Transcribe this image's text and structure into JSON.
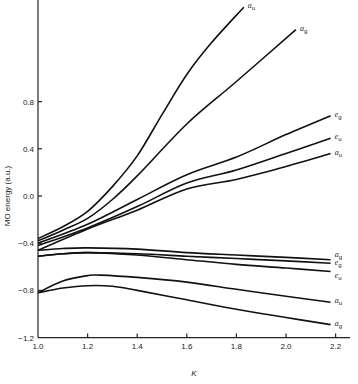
{
  "chart_data": {
    "type": "line",
    "title": "",
    "xlabel": "K",
    "ylabel": "MO energy (a.u.)",
    "xlim": [
      1.0,
      2.25
    ],
    "ylim": [
      -1.2,
      1.65
    ],
    "grid": false,
    "legend": "inline labels at right end of each curve",
    "x_ticks": [
      1.0,
      1.2,
      1.4,
      1.6,
      1.8,
      2.0,
      2.2
    ],
    "x_tick_labels": [
      "1.0",
      "1.2",
      "1.4",
      "1.6",
      "1.8",
      "2.0",
      "2.2"
    ],
    "y_ticks": [
      -1.2,
      -0.8,
      -0.4,
      0.0,
      0.4,
      0.8
    ],
    "y_tick_labels": [
      "−1.2",
      "−0.8",
      "−0.4",
      "0.0",
      "0.4",
      "0.8"
    ],
    "series": [
      {
        "name": "a_u",
        "label_main": "a",
        "label_sub": "u",
        "x": [
          1.0,
          1.1,
          1.2,
          1.3,
          1.4,
          1.5,
          1.6,
          1.7,
          1.83
        ],
        "y": [
          -0.36,
          -0.26,
          -0.13,
          0.08,
          0.34,
          0.69,
          1.03,
          1.3,
          1.6
        ]
      },
      {
        "name": "a_g",
        "label_main": "a",
        "label_sub": "g",
        "x": [
          1.0,
          1.1,
          1.2,
          1.3,
          1.4,
          1.6,
          1.8,
          2.04
        ],
        "y": [
          -0.38,
          -0.29,
          -0.19,
          -0.03,
          0.17,
          0.61,
          0.97,
          1.41
        ]
      },
      {
        "name": "e_g",
        "label_main": "e",
        "label_sub": "g",
        "x": [
          1.0,
          1.2,
          1.4,
          1.6,
          1.8,
          2.0,
          2.18
        ],
        "y": [
          -0.4,
          -0.24,
          -0.03,
          0.18,
          0.33,
          0.52,
          0.68
        ]
      },
      {
        "name": "e_u",
        "label_main": "e",
        "label_sub": "u",
        "x": [
          1.0,
          1.2,
          1.4,
          1.6,
          1.8,
          2.0,
          2.18
        ],
        "y": [
          -0.42,
          -0.27,
          -0.09,
          0.11,
          0.22,
          0.36,
          0.49
        ]
      },
      {
        "name": "a_u",
        "label_main": "a",
        "label_sub": "u",
        "x": [
          1.0,
          1.2,
          1.4,
          1.6,
          1.8,
          2.0,
          2.18
        ],
        "y": [
          -0.46,
          -0.28,
          -0.12,
          0.06,
          0.14,
          0.25,
          0.36
        ]
      },
      {
        "name": "a_g",
        "label_main": "a",
        "label_sub": "g",
        "x": [
          1.0,
          1.1,
          1.2,
          1.4,
          1.6,
          1.8,
          2.0,
          2.18
        ],
        "y": [
          -0.46,
          -0.445,
          -0.44,
          -0.45,
          -0.48,
          -0.5,
          -0.52,
          -0.54
        ]
      },
      {
        "name": "e_g",
        "label_main": "e",
        "label_sub": "g",
        "x": [
          1.0,
          1.1,
          1.2,
          1.4,
          1.6,
          1.8,
          2.0,
          2.18
        ],
        "y": [
          -0.51,
          -0.49,
          -0.48,
          -0.49,
          -0.51,
          -0.53,
          -0.55,
          -0.57
        ]
      },
      {
        "name": "e_u",
        "label_main": "e",
        "label_sub": "u",
        "x": [
          1.0,
          1.1,
          1.2,
          1.4,
          1.6,
          1.8,
          2.0,
          2.18
        ],
        "y": [
          -0.51,
          -0.49,
          -0.48,
          -0.5,
          -0.54,
          -0.58,
          -0.61,
          -0.64
        ]
      },
      {
        "name": "a_u",
        "label_main": "a",
        "label_sub": "u",
        "x": [
          1.0,
          1.1,
          1.2,
          1.25,
          1.4,
          1.6,
          1.8,
          2.0,
          2.18
        ],
        "y": [
          -0.82,
          -0.72,
          -0.675,
          -0.67,
          -0.69,
          -0.73,
          -0.79,
          -0.85,
          -0.9
        ]
      },
      {
        "name": "a_g",
        "label_main": "a",
        "label_sub": "g",
        "x": [
          1.0,
          1.1,
          1.2,
          1.3,
          1.4,
          1.6,
          1.8,
          2.0,
          2.18
        ],
        "y": [
          -0.82,
          -0.78,
          -0.76,
          -0.765,
          -0.8,
          -0.88,
          -0.96,
          -1.03,
          -1.09
        ]
      }
    ]
  }
}
